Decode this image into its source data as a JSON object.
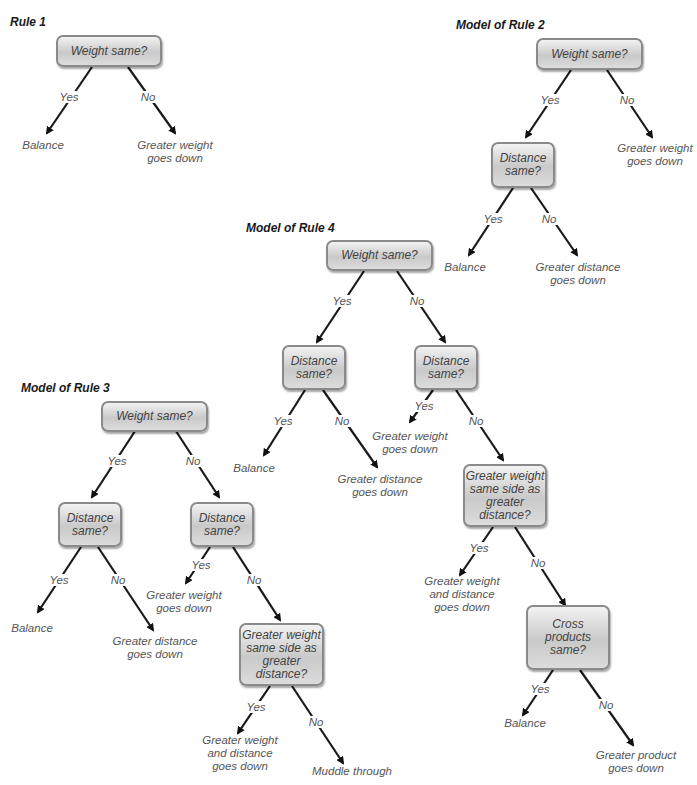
{
  "diagrams": {
    "rule1": {
      "title": "Rule 1",
      "root": "Weight same?",
      "edges": {
        "yes": "Yes",
        "no": "No"
      },
      "leaves": {
        "yes": "Balance",
        "no_l1": "Greater weight",
        "no_l2": "goes down"
      }
    },
    "rule2": {
      "title": "Model of Rule 2",
      "root": "Weight same?",
      "root_edges": {
        "yes": "Yes",
        "no": "No"
      },
      "root_no_leaf": {
        "l1": "Greater weight",
        "l2": "goes down"
      },
      "distance": {
        "l1": "Distance",
        "l2": "same?"
      },
      "distance_edges": {
        "yes": "Yes",
        "no": "No"
      },
      "distance_yes_leaf": "Balance",
      "distance_no_leaf": {
        "l1": "Greater distance",
        "l2": "goes down"
      }
    },
    "rule3": {
      "title": "Model of Rule 3",
      "root": "Weight same?",
      "root_edges": {
        "yes": "Yes",
        "no": "No"
      },
      "left_distance": {
        "l1": "Distance",
        "l2": "same?"
      },
      "left_edges": {
        "yes": "Yes",
        "no": "No"
      },
      "left_yes_leaf": "Balance",
      "left_no_leaf": {
        "l1": "Greater distance",
        "l2": "goes down"
      },
      "right_distance": {
        "l1": "Distance",
        "l2": "same?"
      },
      "right_edges": {
        "yes": "Yes",
        "no": "No"
      },
      "right_yes_leaf": {
        "l1": "Greater weight",
        "l2": "goes down"
      },
      "same_side": {
        "l1": "Greater weight",
        "l2": "same side as",
        "l3": "greater distance?"
      },
      "same_side_edges": {
        "yes": "Yes",
        "no": "No"
      },
      "same_side_yes_leaf": {
        "l1": "Greater weight",
        "l2": "and distance",
        "l3": "goes down"
      },
      "same_side_no_leaf": "Muddle through"
    },
    "rule4": {
      "title": "Model of Rule 4",
      "root": "Weight same?",
      "root_edges": {
        "yes": "Yes",
        "no": "No"
      },
      "left_distance": {
        "l1": "Distance",
        "l2": "same?"
      },
      "left_edges": {
        "yes": "Yes",
        "no": "No"
      },
      "left_yes_leaf": "Balance",
      "left_no_leaf": {
        "l1": "Greater distance",
        "l2": "goes down"
      },
      "right_distance": {
        "l1": "Distance",
        "l2": "same?"
      },
      "right_edges": {
        "yes": "Yes",
        "no": "No"
      },
      "right_yes_leaf": {
        "l1": "Greater weight",
        "l2": "goes down"
      },
      "same_side": {
        "l1": "Greater weight",
        "l2": "same side as",
        "l3": "greater distance?"
      },
      "same_side_edges": {
        "yes": "Yes",
        "no": "No"
      },
      "same_side_yes_leaf": {
        "l1": "Greater weight",
        "l2": "and distance",
        "l3": "goes down"
      },
      "cross": {
        "l1": "Cross products",
        "l2": "same?"
      },
      "cross_edges": {
        "yes": "Yes",
        "no": "No"
      },
      "cross_yes_leaf": "Balance",
      "cross_no_leaf": {
        "l1": "Greater product",
        "l2": "goes down"
      }
    }
  }
}
